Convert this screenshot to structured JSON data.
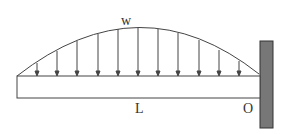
{
  "diagram": {
    "load_label": "w",
    "length_label": "L",
    "support_label": "O",
    "colors": {
      "line": "#444444",
      "wall": "#777777",
      "wall_border": "#333333"
    },
    "arrow_count": 11
  }
}
